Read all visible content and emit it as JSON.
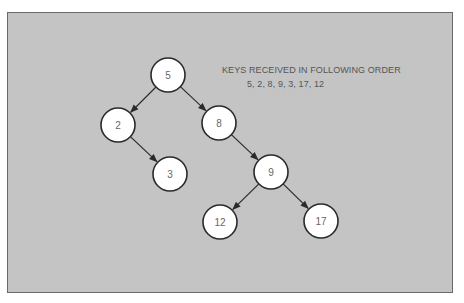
{
  "caption": {
    "title": "KEYS RECEIVED IN FOLLOWING ORDER",
    "sequence": "5, 2, 8, 9, 3, 17, 12"
  },
  "tree": {
    "nodes": [
      {
        "id": "n5",
        "label": "5",
        "x": 168,
        "y": 75
      },
      {
        "id": "n2",
        "label": "2",
        "x": 118,
        "y": 125
      },
      {
        "id": "n8",
        "label": "8",
        "x": 219,
        "y": 123
      },
      {
        "id": "n3",
        "label": "3",
        "x": 170,
        "y": 174
      },
      {
        "id": "n9",
        "label": "9",
        "x": 271,
        "y": 172
      },
      {
        "id": "n12",
        "label": "12",
        "x": 220,
        "y": 222
      },
      {
        "id": "n17",
        "label": "17",
        "x": 321,
        "y": 221
      }
    ],
    "edges": [
      [
        "n5",
        "n2"
      ],
      [
        "n5",
        "n8"
      ],
      [
        "n2",
        "n3"
      ],
      [
        "n8",
        "n9"
      ],
      [
        "n9",
        "n12"
      ],
      [
        "n9",
        "n17"
      ]
    ],
    "radius": 17,
    "colors": {
      "background": "#c4c4c4",
      "node_fill": "#ffffff",
      "stroke": "#2a2a2a",
      "text": "#666666"
    }
  }
}
